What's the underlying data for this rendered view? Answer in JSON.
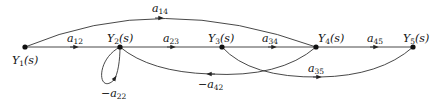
{
  "diagram": {
    "type": "signal-flow-graph",
    "nodes": [
      {
        "id": "Y1",
        "label": "Y",
        "sub": "1",
        "suffix": "(s)"
      },
      {
        "id": "Y2",
        "label": "Y",
        "sub": "2",
        "suffix": "(s)"
      },
      {
        "id": "Y3",
        "label": "Y",
        "sub": "3",
        "suffix": "(s)"
      },
      {
        "id": "Y4",
        "label": "Y",
        "sub": "4",
        "suffix": "(s)"
      },
      {
        "id": "Y5",
        "label": "Y",
        "sub": "5",
        "suffix": "(s)"
      }
    ],
    "edges": [
      {
        "from": "Y1",
        "to": "Y2",
        "gain": "a",
        "sub": "12"
      },
      {
        "from": "Y2",
        "to": "Y3",
        "gain": "a",
        "sub": "23"
      },
      {
        "from": "Y3",
        "to": "Y4",
        "gain": "a",
        "sub": "34"
      },
      {
        "from": "Y4",
        "to": "Y5",
        "gain": "a",
        "sub": "45"
      },
      {
        "from": "Y1",
        "to": "Y4",
        "gain": "a",
        "sub": "14"
      },
      {
        "from": "Y3",
        "to": "Y5",
        "gain": "a",
        "sub": "35"
      },
      {
        "from": "Y4",
        "to": "Y2",
        "gain": "−a",
        "sub": "42"
      },
      {
        "from": "Y2",
        "to": "Y2",
        "gain": "−a",
        "sub": "22"
      }
    ]
  }
}
